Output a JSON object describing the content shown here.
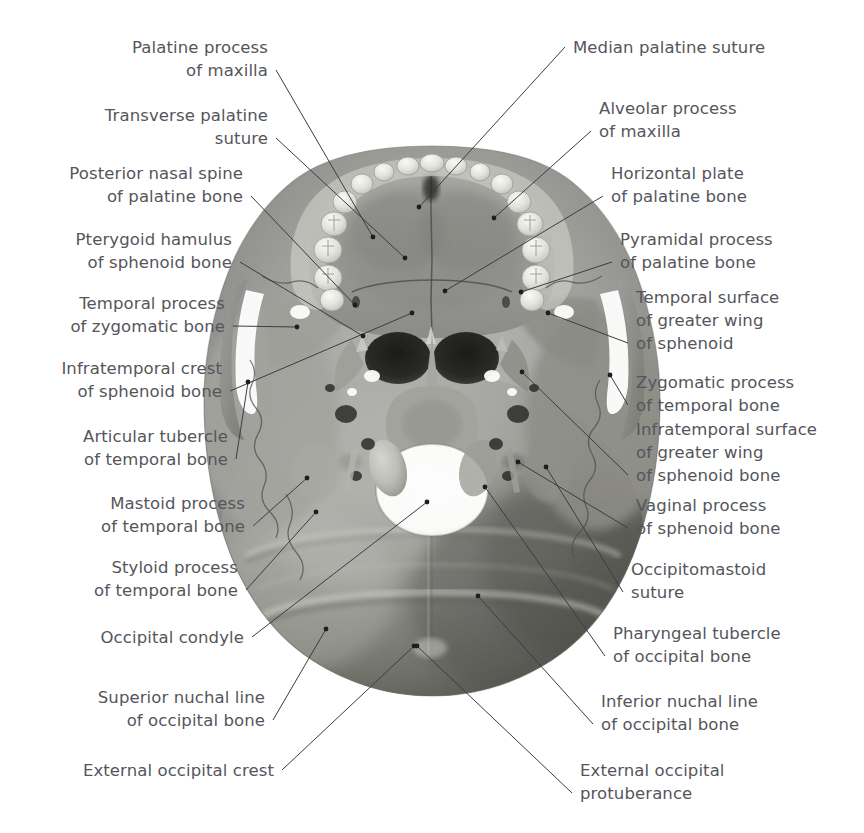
{
  "figure": {
    "background": "#ffffff",
    "text_color": "#55555c",
    "leader_color": "#3c3c42"
  },
  "labels_left": [
    {
      "id": "palatine-process-of-maxilla",
      "lines": [
        "Palatine process",
        "of maxilla"
      ],
      "x": 268,
      "y": 36,
      "anchor_x": 373,
      "anchor_y": 237,
      "bend": null
    },
    {
      "id": "transverse-palatine-suture",
      "lines": [
        "Transverse palatine",
        "suture"
      ],
      "x": 268,
      "y": 104,
      "anchor_x": 405,
      "anchor_y": 258,
      "bend": null
    },
    {
      "id": "posterior-nasal-spine-of-palatine-bone",
      "lines": [
        "Posterior nasal spine",
        "of palatine bone"
      ],
      "x": 243,
      "y": 162,
      "anchor_x": 355,
      "anchor_y": 305,
      "bend": null
    },
    {
      "id": "pterygoid-hamulus-of-sphenoid-bone",
      "lines": [
        "Pterygoid hamulus",
        "of sphenoid bone"
      ],
      "x": 232,
      "y": 228,
      "anchor_x": 363,
      "anchor_y": 336,
      "bend": null
    },
    {
      "id": "temporal-process-of-zygomatic-bone",
      "lines": [
        "Temporal process",
        "of zygomatic bone"
      ],
      "x": 225,
      "y": 292,
      "anchor_x": 297,
      "anchor_y": 327,
      "bend": null
    },
    {
      "id": "infratemporal-crest-of-sphenoid-bone",
      "lines": [
        "Infratemporal crest",
        "of sphenoid bone"
      ],
      "x": 222,
      "y": 357,
      "anchor_x": 412,
      "anchor_y": 313,
      "bend": null
    },
    {
      "id": "articular-tubercle-of-temporal-bone",
      "lines": [
        "Articular tubercle",
        "of temporal bone"
      ],
      "x": 228,
      "y": 425,
      "anchor_x": 248,
      "anchor_y": 382,
      "bend": null
    },
    {
      "id": "mastoid-process-of-temporal-bone",
      "lines": [
        "Mastoid process",
        "of temporal bone"
      ],
      "x": 245,
      "y": 492,
      "anchor_x": 307,
      "anchor_y": 478,
      "bend": null
    },
    {
      "id": "styloid-process-of-temporal-bone",
      "lines": [
        "Styloid process",
        "of temporal bone"
      ],
      "x": 238,
      "y": 556,
      "anchor_x": 316,
      "anchor_y": 512,
      "bend": null
    },
    {
      "id": "occipital-condyle",
      "lines": [
        "Occipital condyle"
      ],
      "x": 244,
      "y": 626,
      "anchor_x": 427,
      "anchor_y": 502,
      "bend": null
    },
    {
      "id": "superior-nuchal-line-of-occipital-bone",
      "lines": [
        "Superior nuchal line",
        "of occipital bone"
      ],
      "x": 265,
      "y": 686,
      "anchor_x": 326,
      "anchor_y": 629,
      "bend": null
    },
    {
      "id": "external-occipital-crest",
      "lines": [
        "External occipital crest"
      ],
      "x": 274,
      "y": 759,
      "anchor_x": 414,
      "anchor_y": 646,
      "bend": null
    }
  ],
  "labels_right": [
    {
      "id": "median-palatine-suture",
      "lines": [
        "Median palatine suture"
      ],
      "x": 573,
      "y": 36,
      "anchor_x": 419,
      "anchor_y": 207,
      "bend": null
    },
    {
      "id": "alveolar-process-of-maxilla",
      "lines": [
        "Alveolar process",
        "of maxilla"
      ],
      "x": 599,
      "y": 97,
      "anchor_x": 494,
      "anchor_y": 218,
      "bend": null
    },
    {
      "id": "horizontal-plate-of-palatine-bone",
      "lines": [
        "Horizontal plate",
        "of palatine bone"
      ],
      "x": 611,
      "y": 162,
      "anchor_x": 445,
      "anchor_y": 291,
      "bend": null
    },
    {
      "id": "pyramidal-process-of-palatine-bone",
      "lines": [
        "Pyramidal process",
        "of palatine bone"
      ],
      "x": 620,
      "y": 228,
      "anchor_x": 521,
      "anchor_y": 292,
      "bend": null
    },
    {
      "id": "temporal-surface-of-greater-wing-of-sphenoid",
      "lines": [
        "Temporal surface",
        "of greater wing",
        "of sphenoid"
      ],
      "x": 636,
      "y": 286,
      "anchor_x": 548,
      "anchor_y": 313,
      "bend": null
    },
    {
      "id": "zygomatic-process-of-temporal-bone",
      "lines": [
        "Zygomatic process",
        "of temporal bone"
      ],
      "x": 636,
      "y": 371,
      "anchor_x": 610,
      "anchor_y": 375,
      "bend": null
    },
    {
      "id": "infratemporal-surface-of-greater-wing-of-sphenoid-bone",
      "lines": [
        "Infratemporal surface",
        "of greater wing",
        "of sphenoid bone"
      ],
      "x": 636,
      "y": 418,
      "anchor_x": 522,
      "anchor_y": 372,
      "bend": null
    },
    {
      "id": "vaginal-process-of-sphenoid-bone",
      "lines": [
        "Vaginal process",
        "of sphenoid bone"
      ],
      "x": 636,
      "y": 494,
      "anchor_x": 518,
      "anchor_y": 462,
      "bend": null
    },
    {
      "id": "occipitomastoid-suture",
      "lines": [
        "Occipitomastoid",
        "suture"
      ],
      "x": 631,
      "y": 558,
      "anchor_x": 546,
      "anchor_y": 467,
      "bend": null
    },
    {
      "id": "pharyngeal-tubercle-of-occipital-bone",
      "lines": [
        "Pharyngeal tubercle",
        "of occipital bone"
      ],
      "x": 613,
      "y": 622,
      "anchor_x": 485,
      "anchor_y": 487,
      "bend": null
    },
    {
      "id": "inferior-nuchal-line-of-occipital-bone",
      "lines": [
        "Inferior nuchal line",
        "of occipital bone"
      ],
      "x": 601,
      "y": 690,
      "anchor_x": 478,
      "anchor_y": 596,
      "bend": null
    },
    {
      "id": "external-occipital-protuberance",
      "lines": [
        "External occipital",
        "protuberance"
      ],
      "x": 580,
      "y": 759,
      "anchor_x": 417,
      "anchor_y": 646,
      "bend": null
    }
  ]
}
